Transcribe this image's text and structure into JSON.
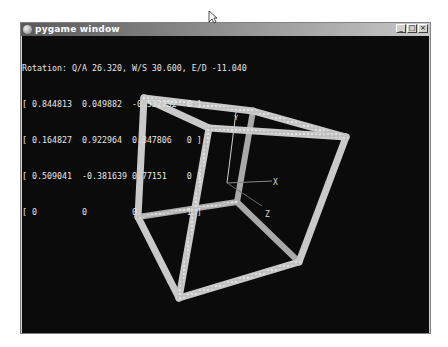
{
  "window": {
    "title": "pygame window",
    "icon": "pygame-snake-icon",
    "buttons": {
      "minimize": "_",
      "maximize": "□",
      "close": "×"
    }
  },
  "hud": {
    "rotation_line": "Rotation: Q/A 26.320, W/S 30.600, E/D -11.040",
    "rotation": {
      "qa": "26.320",
      "ws": "30.600",
      "ed": "-11.040"
    },
    "matrix_rows": [
      "[ 0.844813  0.049882  -0.532732  0 ]",
      "[ 0.164827  0.922964  0.347806   0 ]",
      "[ 0.509041  -0.381639 0.77151    0 ]",
      "[ 0         0         0          1 ]"
    ],
    "matrix": [
      [
        "0.844813",
        "0.049882",
        "-0.532732",
        "0"
      ],
      [
        "0.164827",
        "0.922964",
        "0.347806",
        "0"
      ],
      [
        "0.509041",
        "-0.381639",
        "0.77151",
        "0"
      ],
      [
        "0",
        "0",
        "0",
        "1"
      ]
    ]
  },
  "scene": {
    "axis_labels": {
      "x": "X",
      "y": "Y",
      "z": "Z"
    },
    "cube_color": "#c8c8c8",
    "background_color": "#0b0b0b"
  }
}
